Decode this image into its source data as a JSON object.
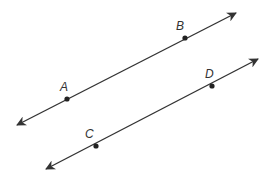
{
  "diagram": {
    "type": "parallel-lines",
    "stroke_color": "#333333",
    "lines": [
      {
        "name": "line-AB",
        "start": [
          17,
          125
        ],
        "end": [
          236,
          13
        ],
        "arrows": "both",
        "points": [
          {
            "label": "A",
            "pos": [
              67,
              99
            ],
            "label_pos": [
              60,
              91
            ]
          },
          {
            "label": "B",
            "pos": [
              185,
              38
            ],
            "label_pos": [
              176,
              30
            ]
          }
        ]
      },
      {
        "name": "line-CD",
        "start": [
          46,
          169
        ],
        "end": [
          258,
          59
        ],
        "arrows": "both",
        "points": [
          {
            "label": "C",
            "pos": [
              96,
              146
            ],
            "label_pos": [
              85,
              138
            ]
          },
          {
            "label": "D",
            "pos": [
              212,
              86
            ],
            "label_pos": [
              205,
              78
            ]
          }
        ]
      }
    ]
  },
  "labels": {
    "A": "A",
    "B": "B",
    "C": "C",
    "D": "D"
  }
}
